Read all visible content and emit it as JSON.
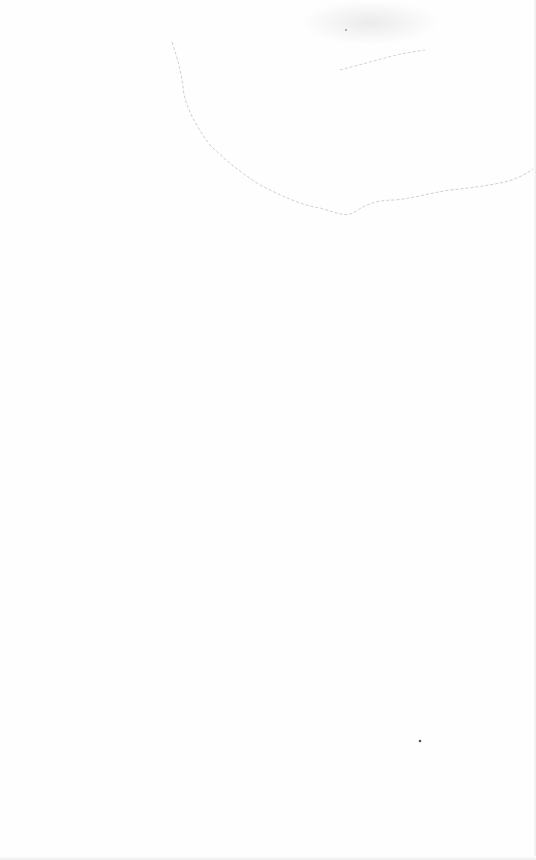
{
  "document": {
    "type": "blank scanned page",
    "text": "",
    "colors": {
      "paper": "#fefefe",
      "stain": "#c8c8c8",
      "speck": "#555555"
    }
  }
}
